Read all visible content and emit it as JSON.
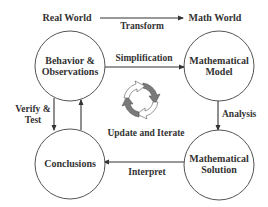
{
  "headers": {
    "left": "Real World",
    "right": "Math World",
    "transform_label": "Transform"
  },
  "nodes": {
    "behavior": {
      "line1": "Behavior &",
      "line2": "Observations"
    },
    "model": {
      "line1": "Mathematical",
      "line2": "Model"
    },
    "solution": {
      "line1": "Mathematical",
      "line2": "Solution"
    },
    "conclusions": {
      "line1": "Conclusions"
    }
  },
  "edges": {
    "simplification": "Simplification",
    "analysis": "Analysis",
    "interpret": "Interpret",
    "verify_line1": "Verify &",
    "verify_line2": "Test"
  },
  "cycle": {
    "label": "Update and Iterate",
    "icon": "refresh-cycle-icon",
    "colors": {
      "dark": "#7a7a7a",
      "light": "#ffffff",
      "outline": "#555555"
    }
  },
  "colors": {
    "text": "#333333",
    "stroke": "#555555",
    "background": "#ffffff"
  }
}
